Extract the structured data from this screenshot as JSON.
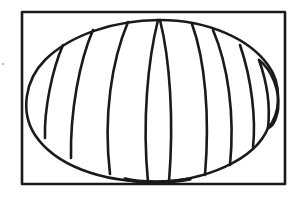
{
  "figure": {
    "description": "Line drawing of an elliptical globe-like shape divided by curved vertical lines, enclosed in a rectangular frame",
    "stroke_color": "#1a1a1a",
    "background_color": "#ffffff",
    "frame": {
      "x": 22,
      "y": 12,
      "width": 263,
      "height": 173
    },
    "ellipse": {
      "cx": 155,
      "cy": 100,
      "rx": 130,
      "ry": 82
    },
    "segment_count": 11
  }
}
